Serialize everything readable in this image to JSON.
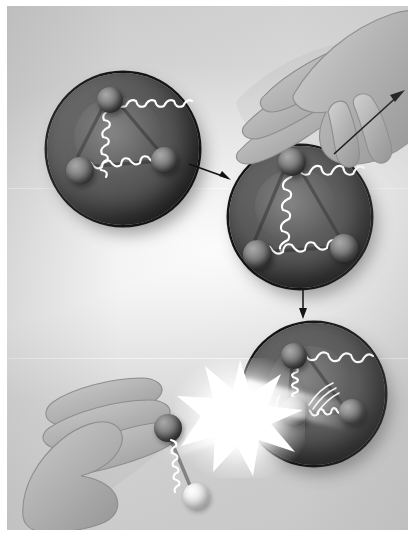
{
  "figure": {
    "border_color": "#ffffff",
    "background_colors": {
      "light": "#e6e6e6",
      "mid": "#d3d3d3",
      "dark": "#c6c6c6"
    },
    "width": 415,
    "height": 536
  },
  "palette": {
    "sphere_fill": "#565656",
    "sphere_rim": "#141414",
    "atom_dark": "#6e6e6e",
    "atom_light": "#dcdcdc",
    "spring_white": "#ffffff",
    "arrow_black": "#111111",
    "flash_white": "#ffffff",
    "skin_gray": "#b4b4b4"
  },
  "panels": [
    {
      "id": "panel-1",
      "name": "relaxed-molecule-sphere",
      "label": "Relaxed molecule",
      "state": "relaxed",
      "spring_state": "compressed",
      "atom_count": 3,
      "atoms": [
        {
          "name": "atom-top",
          "shade": "dark"
        },
        {
          "name": "atom-left",
          "shade": "dark"
        },
        {
          "name": "atom-right",
          "shade": "dark"
        }
      ],
      "bonds": [
        {
          "name": "bond-top-left",
          "coils": 11
        },
        {
          "name": "bond-top-right",
          "coils": 11
        },
        {
          "name": "bond-left-right",
          "coils": 12
        }
      ]
    },
    {
      "id": "panel-2",
      "name": "stretched-molecule-sphere",
      "label": "Stretched molecule",
      "state": "stretched",
      "spring_state": "extended",
      "atom_count": 3,
      "atoms": [
        {
          "name": "atom-top",
          "shade": "dark"
        },
        {
          "name": "atom-left",
          "shade": "dark"
        },
        {
          "name": "atom-right",
          "shade": "dark"
        }
      ],
      "bonds": [
        {
          "name": "bond-top-left",
          "coils": 9
        },
        {
          "name": "bond-top-right",
          "coils": 9
        },
        {
          "name": "bond-left-right",
          "coils": 10
        }
      ]
    },
    {
      "id": "panel-3",
      "name": "vibrating-molecule-sphere",
      "label": "Vibrating molecule after impact",
      "state": "vibrating",
      "spring_state": "mixed",
      "atom_count": 3,
      "atoms": [
        {
          "name": "atom-top",
          "shade": "dark"
        },
        {
          "name": "atom-center",
          "shade": "dark"
        },
        {
          "name": "atom-right",
          "shade": "dark"
        }
      ],
      "bonds": [
        {
          "name": "bond-center-top",
          "coils": 8
        },
        {
          "name": "bond-top-right",
          "coils": 12
        },
        {
          "name": "bond-center-right",
          "coils": 11
        }
      ],
      "motion_marks": [
        "vibration-arcs-left",
        "vibration-arcs-right"
      ]
    }
  ],
  "hands": [
    {
      "id": "hand-top",
      "name": "hand-pulling-atom",
      "action": "pulls atom upward to stretch the bonds",
      "fingers": 4,
      "grips": "atom-top of panel-2"
    },
    {
      "id": "hand-bottom",
      "name": "hand-launching-atom",
      "action": "holds the projectile atom and spring before impact",
      "fingers": 4,
      "grips": "projectile-atom"
    }
  ],
  "projectile": {
    "name": "projectile-assembly",
    "atom": {
      "name": "projectile-atom",
      "shade": "dark"
    },
    "spring": {
      "name": "projectile-spring",
      "coils": 9
    },
    "tail_ball": {
      "name": "projectile-tail-ball",
      "shade": "light"
    }
  },
  "effects": [
    {
      "id": "flash",
      "name": "collision-flash",
      "kind": "starburst",
      "color": "#ffffff"
    },
    {
      "id": "beam-left",
      "name": "impact-beam-incoming"
    },
    {
      "id": "beam-right",
      "name": "impact-beam-outgoing"
    }
  ],
  "arrows": [
    {
      "id": "arrow-1",
      "name": "arrow-step1-to-step2",
      "direction": "right-down",
      "from": "panel-1",
      "to": "panel-2"
    },
    {
      "id": "arrow-2",
      "name": "arrow-step2-to-step3",
      "direction": "down",
      "from": "panel-2",
      "to": "panel-3"
    },
    {
      "id": "arrow-pull",
      "name": "arrow-pull-direction",
      "direction": "up-right",
      "from": "hand-top",
      "to": "stretch"
    }
  ]
}
